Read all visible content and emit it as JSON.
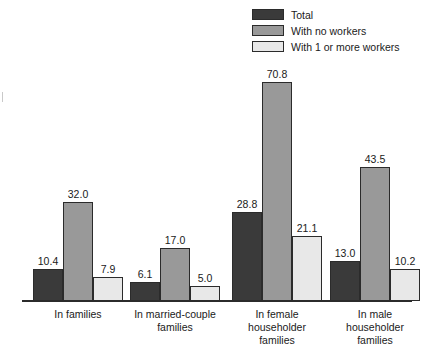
{
  "chart_data": {
    "type": "bar",
    "title": "",
    "subtitle": "",
    "xlabel": "",
    "ylabel": "",
    "ylim": [
      0,
      75
    ],
    "grid": false,
    "legend_position": "top-right",
    "categories": [
      "In families",
      "In married-couple\nfamilies",
      "In female\nhouseholder\nfamilies",
      "In male\nhouseholder\nfamilies"
    ],
    "series": [
      {
        "name": "Total",
        "color": "#3a3a3a",
        "values": [
          10.4,
          28.8,
          6.1,
          13.0
        ]
      },
      {
        "name": "With no workers",
        "color": "#999999",
        "values": [
          32.0,
          70.8,
          17.0,
          43.5
        ]
      },
      {
        "name": "With 1 or more workers",
        "color": "#e8e8e8",
        "values": [
          7.9,
          21.1,
          5.0,
          10.2
        ]
      }
    ],
    "groups": [
      {
        "category": "In families",
        "bars": [
          {
            "series": "Total",
            "value": 10.4,
            "label": "10.4"
          },
          {
            "series": "With no workers",
            "value": 32.0,
            "label": "32.0"
          },
          {
            "series": "With 1 or more workers",
            "value": 7.9,
            "label": "7.9"
          }
        ]
      },
      {
        "category": "In married-couple\nfamilies",
        "bars": [
          {
            "series": "Total",
            "value": 6.1,
            "label": "6.1"
          },
          {
            "series": "With no workers",
            "value": 17.0,
            "label": "17.0"
          },
          {
            "series": "With 1 or more workers",
            "value": 5.0,
            "label": "5.0"
          }
        ]
      },
      {
        "category": "In female\nhouseholder\nfamilies",
        "bars": [
          {
            "series": "Total",
            "value": 28.8,
            "label": "28.8"
          },
          {
            "series": "With no workers",
            "value": 70.8,
            "label": "70.8"
          },
          {
            "series": "With 1 or more workers",
            "value": 21.1,
            "label": "21.1"
          }
        ]
      },
      {
        "category": "In male\nhouseholder\nfamilies",
        "bars": [
          {
            "series": "Total",
            "value": 13.0,
            "label": "13.0"
          },
          {
            "series": "With no workers",
            "value": 43.5,
            "label": "43.5"
          },
          {
            "series": "With 1 or more workers",
            "value": 10.2,
            "label": "10.2"
          }
        ]
      }
    ]
  },
  "legend": {
    "items": [
      {
        "label": "Total",
        "color": "#3a3a3a"
      },
      {
        "label": "With no workers",
        "color": "#999999"
      },
      {
        "label": "With 1 or more workers",
        "color": "#e8e8e8"
      }
    ]
  },
  "colors": {
    "series_total": "#3a3a3a",
    "series_no_workers": "#999999",
    "series_one_or_more_workers": "#e8e8e8",
    "outline": "#2b2b2b",
    "background": "#ffffff",
    "text": "#1a1a1a"
  }
}
